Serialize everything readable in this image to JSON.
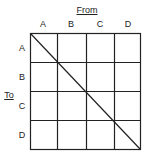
{
  "diagram": {
    "from_label": "From",
    "to_label": "To",
    "columns": [
      "A",
      "B",
      "C",
      "D"
    ],
    "rows": [
      "A",
      "B",
      "C",
      "D"
    ],
    "diagonal": "top-left to bottom-right",
    "line_color": "#222222"
  }
}
